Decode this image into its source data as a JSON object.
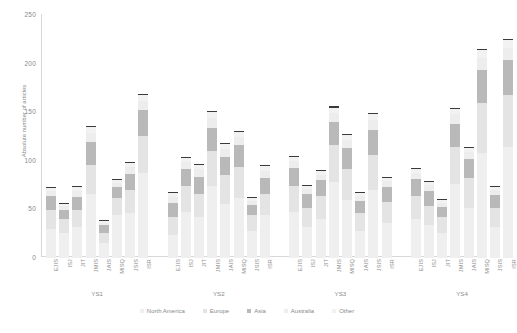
{
  "chart_data": {
    "type": "bar",
    "subtype": "stacked-bar",
    "title": "",
    "xlabel": "",
    "ylabel": "Absolute number of articles",
    "ylim": [
      0,
      250
    ],
    "yticks": [
      0,
      50,
      100,
      150,
      200,
      250
    ],
    "grid": false,
    "legend_position": "bottom",
    "groups": [
      "YS1",
      "YS2",
      "YS3",
      "YS4"
    ],
    "categories": [
      "EJIS",
      "ISJ",
      "JIT",
      "JMIS",
      "JAIS",
      "MISQ",
      "JSIS",
      "ISR"
    ],
    "series": [
      {
        "name": "North America",
        "color": "#efefef"
      },
      {
        "name": "Europe",
        "color": "#e4e4e4"
      },
      {
        "name": "Asia",
        "color": "#b9b9b9"
      },
      {
        "name": "Australia",
        "color": "#ededed"
      },
      {
        "name": "Other",
        "color": "#f2f2f2"
      }
    ],
    "bars": [
      {
        "group": "YS1",
        "category": "EJIS",
        "total": 72,
        "segments": [
          30,
          20,
          14,
          5,
          3
        ]
      },
      {
        "group": "YS1",
        "category": "ISJ",
        "total": 56,
        "segments": [
          26,
          14,
          10,
          4,
          2
        ]
      },
      {
        "group": "YS1",
        "category": "JIT",
        "total": 73,
        "segments": [
          32,
          18,
          13,
          6,
          4
        ]
      },
      {
        "group": "YS1",
        "category": "JMIS",
        "total": 135,
        "segments": [
          66,
          30,
          24,
          9,
          6
        ]
      },
      {
        "group": "YS1",
        "category": "JAIS",
        "total": 38,
        "segments": [
          16,
          10,
          8,
          2,
          2
        ]
      },
      {
        "group": "YS1",
        "category": "MISQ",
        "total": 80,
        "segments": [
          44,
          18,
          11,
          4,
          3
        ]
      },
      {
        "group": "YS1",
        "category": "JSIS",
        "total": 98,
        "segments": [
          46,
          24,
          17,
          7,
          4
        ]
      },
      {
        "group": "YS1",
        "category": "ISR",
        "total": 168,
        "segments": [
          88,
          38,
          26,
          10,
          6
        ]
      },
      {
        "group": "YS2",
        "category": "EJIS",
        "total": 67,
        "segments": [
          24,
          18,
          15,
          6,
          4
        ]
      },
      {
        "group": "YS2",
        "category": "ISJ",
        "total": 103,
        "segments": [
          48,
          26,
          18,
          7,
          4
        ]
      },
      {
        "group": "YS2",
        "category": "JIT",
        "total": 96,
        "segments": [
          42,
          24,
          18,
          8,
          4
        ]
      },
      {
        "group": "YS2",
        "category": "JMIS",
        "total": 150,
        "segments": [
          74,
          36,
          24,
          10,
          6
        ]
      },
      {
        "group": "YS2",
        "category": "JAIS",
        "total": 117,
        "segments": [
          56,
          30,
          18,
          8,
          5
        ]
      },
      {
        "group": "YS2",
        "category": "MISQ",
        "total": 130,
        "segments": [
          62,
          32,
          22,
          9,
          5
        ]
      },
      {
        "group": "YS2",
        "category": "JSIS",
        "total": 62,
        "segments": [
          28,
          16,
          11,
          4,
          3
        ]
      },
      {
        "group": "YS2",
        "category": "ISR",
        "total": 95,
        "segments": [
          44,
          22,
          17,
          7,
          5
        ]
      },
      {
        "group": "YS3",
        "category": "EJIS",
        "total": 104,
        "segments": [
          48,
          26,
          19,
          7,
          4
        ]
      },
      {
        "group": "YS3",
        "category": "ISJ",
        "total": 74,
        "segments": [
          32,
          20,
          14,
          5,
          3
        ]
      },
      {
        "group": "YS3",
        "category": "JIT",
        "total": 90,
        "segments": [
          40,
          24,
          16,
          6,
          4
        ]
      },
      {
        "group": "YS3",
        "category": "JMIS",
        "total": 155,
        "segments": [
          78,
          38,
          24,
          9,
          6
        ]
      },
      {
        "group": "YS3",
        "category": "MISQ",
        "total": 127,
        "segments": [
          60,
          32,
          21,
          9,
          5
        ]
      },
      {
        "group": "YS3",
        "category": "JAIS",
        "total": 67,
        "segments": [
          28,
          18,
          13,
          5,
          3
        ]
      },
      {
        "group": "YS3",
        "category": "JSIS",
        "total": 148,
        "segments": [
          70,
          36,
          26,
          10,
          6
        ]
      },
      {
        "group": "YS3",
        "category": "ISR",
        "total": 82,
        "segments": [
          36,
          22,
          15,
          6,
          3
        ]
      },
      {
        "group": "YS4",
        "category": "EJIS",
        "total": 92,
        "segments": [
          40,
          24,
          17,
          7,
          4
        ]
      },
      {
        "group": "YS4",
        "category": "ISJ",
        "total": 78,
        "segments": [
          34,
          20,
          15,
          6,
          3
        ]
      },
      {
        "group": "YS4",
        "category": "JIT",
        "total": 60,
        "segments": [
          26,
          16,
          11,
          4,
          3
        ]
      },
      {
        "group": "YS4",
        "category": "JMIS",
        "total": 153,
        "segments": [
          76,
          38,
          24,
          10,
          5
        ]
      },
      {
        "group": "YS4",
        "category": "JAIS",
        "total": 113,
        "segments": [
          52,
          30,
          20,
          7,
          4
        ]
      },
      {
        "group": "YS4",
        "category": "MISQ",
        "total": 214,
        "segments": [
          108,
          52,
          34,
          12,
          8
        ]
      },
      {
        "group": "YS4",
        "category": "JSIS",
        "total": 73,
        "segments": [
          32,
          20,
          13,
          5,
          3
        ]
      },
      {
        "group": "YS4",
        "category": "ISR",
        "total": 224,
        "segments": [
          114,
          54,
          36,
          12,
          8
        ]
      }
    ]
  }
}
